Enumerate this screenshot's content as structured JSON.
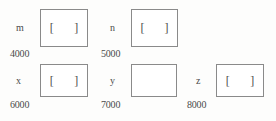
{
  "diagram": {
    "type": "memory-cell-diagram",
    "background_color": "#fdfdfc",
    "box_border_color": "#8a8a8a",
    "text_color": "#4a4a4a",
    "bracket_open": "[",
    "bracket_close": "]",
    "cells": [
      {
        "name": "m",
        "address": "4000",
        "content": "[    ]",
        "empty": false,
        "row": 1,
        "box": {
          "x": 40,
          "y": 9,
          "width": 48,
          "height": 38
        },
        "label_pos": {
          "x": 16,
          "y": 23
        },
        "address_pos": {
          "x": 10,
          "y": 49
        }
      },
      {
        "name": "n",
        "address": "5000",
        "content": "[    ]",
        "empty": false,
        "row": 1,
        "box": {
          "x": 131,
          "y": 9,
          "width": 47,
          "height": 38
        },
        "label_pos": {
          "x": 110,
          "y": 23
        },
        "address_pos": {
          "x": 101,
          "y": 49
        }
      },
      {
        "name": "x",
        "address": "6000",
        "content": "[    ]",
        "empty": false,
        "row": 2,
        "box": {
          "x": 40,
          "y": 64,
          "width": 48,
          "height": 33
        },
        "label_pos": {
          "x": 16,
          "y": 76
        },
        "address_pos": {
          "x": 10,
          "y": 100
        }
      },
      {
        "name": "y",
        "address": "7000",
        "content": "",
        "empty": true,
        "row": 2,
        "box": {
          "x": 131,
          "y": 64,
          "width": 46,
          "height": 33
        },
        "label_pos": {
          "x": 110,
          "y": 76
        },
        "address_pos": {
          "x": 101,
          "y": 100
        }
      },
      {
        "name": "z",
        "address": "8000",
        "content": "[    ]",
        "empty": false,
        "row": 2,
        "box": {
          "x": 216,
          "y": 64,
          "width": 48,
          "height": 33
        },
        "label_pos": {
          "x": 196,
          "y": 76
        },
        "address_pos": {
          "x": 187,
          "y": 100
        }
      }
    ]
  }
}
